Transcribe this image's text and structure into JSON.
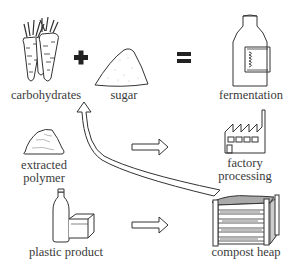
{
  "diagram": {
    "nodes": [
      {
        "id": "carbohydrates",
        "label": "carbohydrates",
        "icon": "carrots-icon"
      },
      {
        "id": "sugar",
        "label": "sugar",
        "icon": "sugar-pile-icon"
      },
      {
        "id": "fermentation",
        "label": "fermentation",
        "icon": "fermentation-bottle-icon"
      },
      {
        "id": "extracted_polymer",
        "label_line1": "extracted",
        "label_line2": "polymer",
        "icon": "polymer-lump-icon"
      },
      {
        "id": "factory_processing",
        "label_line1": "factory",
        "label_line2": "processing",
        "icon": "factory-icon"
      },
      {
        "id": "plastic_product",
        "label": "plastic product",
        "icon": "bottle-and-box-icon"
      },
      {
        "id": "compost_heap",
        "label": "compost heap",
        "icon": "compost-bin-icon"
      }
    ],
    "operators": [
      {
        "symbol": "+",
        "between": [
          "carbohydrates",
          "sugar"
        ]
      },
      {
        "symbol": "=",
        "between": [
          "sugar",
          "fermentation"
        ]
      }
    ],
    "edges": [
      {
        "from": "extracted_polymer",
        "to": "factory_processing",
        "style": "hollow-arrow"
      },
      {
        "from": "plastic_product",
        "to": "compost_heap",
        "style": "hollow-arrow"
      },
      {
        "from": "compost_heap",
        "to": "carbohydrates",
        "style": "curved-hollow-arrow"
      }
    ],
    "colors": {
      "line": "#333333",
      "text": "#3a3a3a",
      "background": "#ffffff"
    }
  }
}
